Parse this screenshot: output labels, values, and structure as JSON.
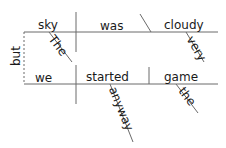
{
  "diagram": {
    "type": "sentence-diagram",
    "sentence": "The sky was very cloudy but we started the game anyway",
    "colors": {
      "line": "#6a6a6a",
      "text": "#1a1a1a",
      "background": "#ffffff"
    },
    "conjunction": {
      "text": "but"
    },
    "clause1": {
      "subject": "sky",
      "verb": "was",
      "complement": "cloudy",
      "subject_modifier": "The",
      "complement_modifier": "very"
    },
    "clause2": {
      "subject": "we",
      "verb": "started",
      "object": "game",
      "verb_modifier": "anyway",
      "object_modifier": "the"
    }
  }
}
